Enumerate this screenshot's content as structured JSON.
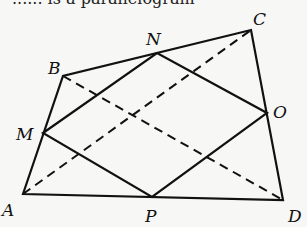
{
  "diagram": {
    "type": "geometry",
    "top_text_partial": "...... is a parallelogram",
    "vertices": {
      "A": {
        "label": "A",
        "x": 23,
        "y": 194
      },
      "B": {
        "label": "B",
        "x": 63,
        "y": 76
      },
      "C": {
        "label": "C",
        "x": 251,
        "y": 30
      },
      "D": {
        "label": "D",
        "x": 283,
        "y": 200
      },
      "M": {
        "label": "M",
        "x": 43,
        "y": 133
      },
      "N": {
        "label": "N",
        "x": 157,
        "y": 53
      },
      "O": {
        "label": "O",
        "x": 267,
        "y": 113
      },
      "P": {
        "label": "P",
        "x": 152,
        "y": 197
      }
    },
    "solid_edges": [
      [
        "A",
        "B"
      ],
      [
        "B",
        "C"
      ],
      [
        "C",
        "D"
      ],
      [
        "D",
        "A"
      ],
      [
        "M",
        "N"
      ],
      [
        "N",
        "O"
      ],
      [
        "O",
        "P"
      ],
      [
        "P",
        "M"
      ]
    ],
    "dashed_edges": [
      [
        "A",
        "C"
      ],
      [
        "B",
        "D"
      ]
    ],
    "labels": {
      "A": "A",
      "B": "B",
      "C": "C",
      "D": "D",
      "M": "M",
      "N": "N",
      "O": "O",
      "P": "P"
    }
  }
}
